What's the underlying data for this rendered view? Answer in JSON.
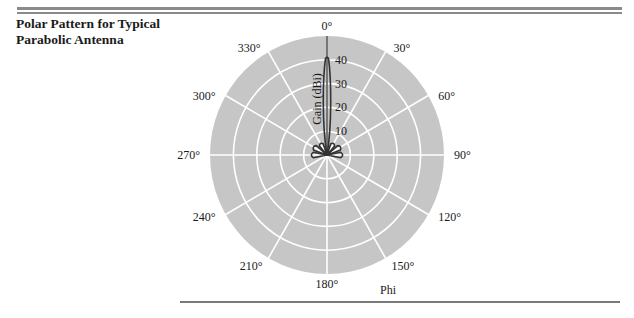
{
  "figure": {
    "title_line1": "Polar Pattern for Typical",
    "title_line2": "Parabolic Antenna"
  },
  "colors": {
    "plot_background": "#c6c6c6",
    "grid": "#ffffff",
    "pattern": "#333333",
    "text": "#1a1a1a"
  },
  "chart_data": {
    "type": "polar",
    "title": "Polar Pattern for Typical Parabolic Antenna",
    "angular_axis_label": "Phi",
    "radial_axis_label": "Gain (dBi)",
    "angular_ticks": [
      "0°",
      "30°",
      "60°",
      "90°",
      "120°",
      "150°",
      "180°",
      "210°",
      "240°",
      "270°",
      "300°",
      "330°"
    ],
    "radial_ticks": [
      10,
      20,
      30,
      40
    ],
    "radial_range": [
      0,
      50
    ],
    "grid": true,
    "series": [
      {
        "name": "Gain pattern",
        "main_lobe": {
          "phi_deg": 0,
          "gain_dbi": 41,
          "half_width_deg": 2
        },
        "side_lobes": [
          {
            "phi_deg": -90,
            "gain_dbi": 6
          },
          {
            "phi_deg": -60,
            "gain_dbi": 6
          },
          {
            "phi_deg": -30,
            "gain_dbi": 5
          },
          {
            "phi_deg": 30,
            "gain_dbi": 5
          },
          {
            "phi_deg": 60,
            "gain_dbi": 6
          },
          {
            "phi_deg": 90,
            "gain_dbi": 6
          }
        ]
      }
    ]
  }
}
